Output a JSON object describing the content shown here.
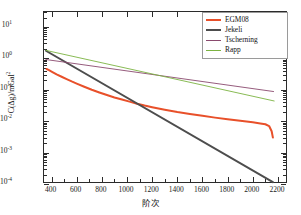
{
  "chart_data": {
    "type": "line",
    "title": "",
    "xlabel": "阶次",
    "ylabel": "C(Δg)/mGal²",
    "ylabel_base": "C(Δg)/mGal",
    "ylabel_exp": "2",
    "xlim": [
      340,
      2280
    ],
    "ylim": [
      0.0001,
      30
    ],
    "yscale": "log",
    "xscale": "linear",
    "grid": false,
    "legend_position": "upper right",
    "xticks": [
      400,
      600,
      800,
      1000,
      1200,
      1400,
      1600,
      1800,
      2000,
      2200
    ],
    "xtick_labels": [
      "400",
      "600",
      "800",
      "1000",
      "1200",
      "1400",
      "1600",
      "1800",
      "2000",
      "2200"
    ],
    "yticks": [
      10,
      1,
      0.1,
      0.01,
      0.001,
      0.0001
    ],
    "ytick_labels": [
      "10¹",
      "10⁰",
      "10⁻¹",
      "10⁻²",
      "10⁻³",
      "10⁻⁴"
    ],
    "ytick_mantissa": "10",
    "ytick_exponents": [
      "1",
      "0",
      "-1",
      "-2",
      "-3",
      "-4"
    ],
    "series": [
      {
        "name": "EGM08",
        "color": "#e8502a",
        "width": 2.0,
        "x": [
          360,
          380,
          400,
          440,
          480,
          520,
          560,
          600,
          660,
          720,
          780,
          840,
          900,
          960,
          1020,
          1080,
          1140,
          1200,
          1300,
          1400,
          1500,
          1600,
          1700,
          1800,
          1900,
          2000,
          2060,
          2100,
          2130,
          2150,
          2160
        ],
        "y": [
          0.46,
          0.42,
          0.38,
          0.31,
          0.26,
          0.22,
          0.185,
          0.158,
          0.125,
          0.1,
          0.082,
          0.068,
          0.057,
          0.049,
          0.042,
          0.036,
          0.0315,
          0.028,
          0.0232,
          0.0196,
          0.017,
          0.0148,
          0.013,
          0.0115,
          0.0103,
          0.0092,
          0.0085,
          0.008,
          0.007,
          0.0048,
          0.003
        ]
      },
      {
        "name": "Jekeli",
        "color": "#4d4d4d",
        "width": 2.0,
        "x": [
          355,
          2160
        ],
        "y": [
          1.75,
          0.000115
        ]
      },
      {
        "name": "Tscherning",
        "color": "#8a4a6e",
        "width": 0.9,
        "x": [
          355,
          2165
        ],
        "y": [
          0.92,
          0.088
        ]
      },
      {
        "name": "Rapp",
        "color": "#7cb342",
        "width": 0.9,
        "x": [
          355,
          2170
        ],
        "y": [
          1.8,
          0.044
        ]
      }
    ]
  },
  "legend": {
    "entries": [
      {
        "label": "EGM08",
        "color": "#e8502a",
        "width": 2.0
      },
      {
        "label": "Jekeli",
        "color": "#4d4d4d",
        "width": 2.0
      },
      {
        "label": "Tscherning",
        "color": "#8a4a6e",
        "width": 0.9
      },
      {
        "label": "Rapp",
        "color": "#7cb342",
        "width": 0.9
      }
    ]
  },
  "axes": {
    "frame_color": "#2b2b2b",
    "background": "#ffffff"
  }
}
